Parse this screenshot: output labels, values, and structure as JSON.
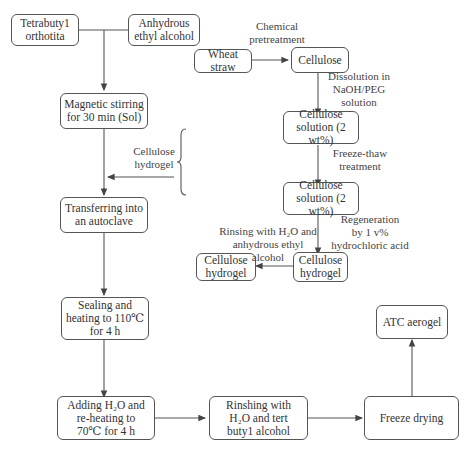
{
  "diagram": {
    "type": "process-flowchart",
    "nodes": {
      "tetrabutyl": "Tetrabuty1\northotita",
      "ethanol": "Anhydrous\nethyl alcohol",
      "magnetic": "Magnetic stirring\nfor 30 min (Sol)",
      "transfer": "Transferring into\nan autoclave",
      "sealing": "Sealing and\nheating to 110℃\nfor 4 h",
      "adding": "Adding H₂O and\nre-heating to\n70℃ for 4 h",
      "rinsing_tba": "Rinshing with\nH₂O and tert\nbuty1 alcohol",
      "freeze_drying": "Freeze drying",
      "atc_aerogel": "ATC aerogel",
      "wheat_straw": "Wheat straw",
      "cellulose": "Cellulose",
      "solution1": "Cellulose\nsolution (2 wt%)",
      "solution2": "Cellulose\nsolution (2 wt%)",
      "hydrogel_regen": "Cellulose\nhydrogel",
      "hydrogel_final": "Cellulose\nhydrogel"
    },
    "edge_labels": {
      "chemical_pretreatment": "Chemical\npretreatment",
      "dissolution": "Dissolution in\nNaOH/PEG\nsolution",
      "freeze_thaw": "Freeze-thaw\ntreatment",
      "regeneration": "Regeneration\nby 1 v%\nhydrochloric acid",
      "rinsing_ethanol": "Rinsing with H₂O and\nanhydrous ethyl\nalcohol",
      "cellulose_hydrogel_input": "Cellulose\nhydrogel"
    },
    "colors": {
      "line": "#555555",
      "text": "#333333",
      "background": "#ffffff"
    }
  }
}
